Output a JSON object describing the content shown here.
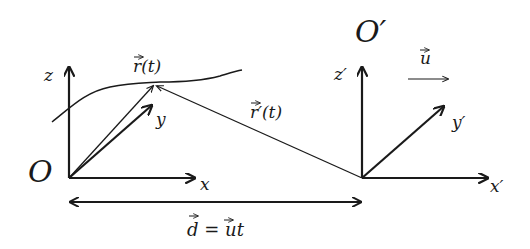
{
  "diagram": {
    "type": "reference-frames",
    "labels": {
      "origin": "O",
      "origin_prime": "O′",
      "x": "x",
      "y": "y",
      "z": "z",
      "x_prime": "x′",
      "y_prime": "y′",
      "z_prime": "z′",
      "r": "r(t)",
      "r_prime": "r′(t)",
      "u": "u",
      "d_eq_lhs": "d",
      "d_eq_mid": " = ",
      "d_eq_u": "u",
      "d_eq_t": "t"
    },
    "colors": {
      "stroke": "#1a1a1a",
      "background": "#ffffff"
    }
  }
}
